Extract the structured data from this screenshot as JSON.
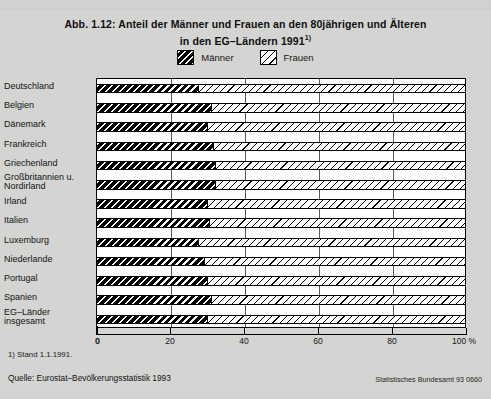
{
  "title": {
    "line1": "Abb. 1.12: Anteil der Männer und Frauen an den 80jährigen und Älteren",
    "line2": "in den EG–Ländern 1991",
    "line2_superscript": "1)"
  },
  "legend": {
    "position": "top-center",
    "items": [
      {
        "label": "Männer",
        "swatch": "male-hatch-swatch"
      },
      {
        "label": "Frauen",
        "swatch": "female-hatch-swatch"
      }
    ]
  },
  "axis": {
    "tick_labels": [
      "0",
      "20",
      "40",
      "60",
      "80",
      "100 %"
    ],
    "tick_values": [
      0,
      20,
      40,
      60,
      80,
      100
    ]
  },
  "footnotes": {
    "footnote1": "1) Stand 1.1.1991.",
    "source": "Quelle: Eurostat–Bevölkerungsstatistik 1993",
    "credit": "Statistisches Bundesamt 93 0660"
  },
  "chart_data": {
    "type": "bar",
    "orientation": "horizontal",
    "stacked": true,
    "title": "Abb. 1.12: Anteil der Männer und Frauen an den 80jährigen und Älteren in den EG–Ländern 1991",
    "xlabel": "",
    "ylabel": "",
    "xlim": [
      0,
      100
    ],
    "xticks": [
      0,
      20,
      40,
      60,
      80,
      100
    ],
    "grid": true,
    "categories": [
      "Deutschland",
      "Belgien",
      "Dänemark",
      "Frankreich",
      "Griechenland",
      "Großbritannien u. Nordirland",
      "Irland",
      "Italien",
      "Luxemburg",
      "Niederlande",
      "Portugal",
      "Spanien",
      "EG–Länder insgesamt"
    ],
    "categories_display": [
      [
        "Deutschland"
      ],
      [
        "Belgien"
      ],
      [
        "Dänemark"
      ],
      [
        "Frankreich"
      ],
      [
        "Griechenland"
      ],
      [
        "Großbritannien u.",
        "Nordirland"
      ],
      [
        "Irland"
      ],
      [
        "Italien"
      ],
      [
        "Luxemburg"
      ],
      [
        "Niederlande"
      ],
      [
        "Portugal"
      ],
      [
        "Spanien"
      ],
      [
        "EG–Länder",
        "insgesamt"
      ]
    ],
    "series": [
      {
        "name": "Männer",
        "values": [
          27.5,
          31.0,
          30.0,
          31.5,
          32.0,
          32.0,
          30.0,
          30.5,
          27.5,
          29.0,
          30.0,
          31.0,
          30.0
        ]
      },
      {
        "name": "Frauen",
        "values": [
          72.5,
          69.0,
          70.0,
          68.5,
          68.0,
          68.0,
          70.0,
          69.5,
          72.5,
          71.0,
          70.0,
          69.0,
          70.0
        ]
      }
    ]
  }
}
